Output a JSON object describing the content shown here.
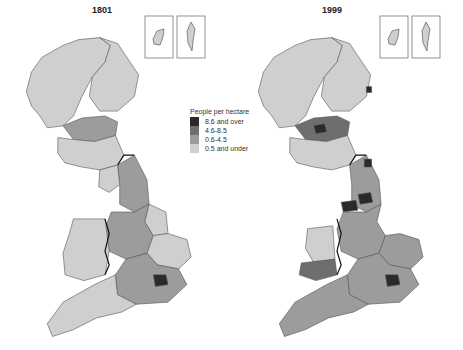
{
  "figure": {
    "title_left": "1801",
    "title_right": "1999"
  },
  "legend": {
    "title": "People per hectare",
    "classes": [
      {
        "label": "8.6 and over",
        "color": "#2a2a2a"
      },
      {
        "label": "4.6-8.5",
        "color": "#6e6e6e"
      },
      {
        "label": "0.6-4.5",
        "color": "#9c9c9c"
      },
      {
        "label": "0.5 and under",
        "color": "#cfcfcf"
      }
    ]
  },
  "chart_data": {
    "type": "choropleth",
    "unit": "People per hectare",
    "legend_title": "People per hectare",
    "legend_position": "center, between the two maps",
    "classes": [
      "8.6 and over",
      "4.6-8.5",
      "0.6-4.5",
      "0.5 and under"
    ],
    "maps": [
      {
        "year": "1801",
        "note": "Mostly '0.5 and under' and '0.6-4.5'; only London in '8.6 and over'",
        "regions": [
          {
            "name": "Highlands & Islands",
            "class": "0.5 and under"
          },
          {
            "name": "North-east Scotland",
            "class": "0.5 and under"
          },
          {
            "name": "Central Scotland",
            "class": "0.6-4.5"
          },
          {
            "name": "Southern Scotland",
            "class": "0.5 and under"
          },
          {
            "name": "Northern England",
            "class": "0.6-4.5"
          },
          {
            "name": "Cumbria",
            "class": "0.5 and under"
          },
          {
            "name": "Midlands",
            "class": "0.6-4.5"
          },
          {
            "name": "Lincolnshire",
            "class": "0.5 and under"
          },
          {
            "name": "East Anglia",
            "class": "0.5 and under"
          },
          {
            "name": "Wales",
            "class": "0.5 and under"
          },
          {
            "name": "South-west England",
            "class": "0.5 and under"
          },
          {
            "name": "South-east England",
            "class": "0.6-4.5"
          },
          {
            "name": "London",
            "class": "8.6 and over"
          },
          {
            "name": "Orkney (inset)",
            "class": "0.5 and under"
          },
          {
            "name": "Shetland (inset)",
            "class": "0.5 and under"
          }
        ]
      },
      {
        "year": "1999",
        "note": "Predominantly '0.6-4.5'; several urban areas in '8.6 and over'",
        "regions": [
          {
            "name": "Highlands & Islands",
            "class": "0.5 and under"
          },
          {
            "name": "North-east Scotland",
            "class": "0.5 and under"
          },
          {
            "name": "Aberdeen",
            "class": "8.6 and over"
          },
          {
            "name": "Central Scotland",
            "class": "4.6-8.5"
          },
          {
            "name": "Glasgow",
            "class": "8.6 and over"
          },
          {
            "name": "Southern Scotland",
            "class": "0.5 and under"
          },
          {
            "name": "Northern England",
            "class": "0.6-4.5"
          },
          {
            "name": "Tyneside",
            "class": "8.6 and over"
          },
          {
            "name": "Greater Manchester & Merseyside",
            "class": "8.6 and over"
          },
          {
            "name": "West Yorkshire",
            "class": "8.6 and over"
          },
          {
            "name": "West Midlands",
            "class": "8.6 and over"
          },
          {
            "name": "Midlands",
            "class": "0.6-4.5"
          },
          {
            "name": "East Anglia",
            "class": "0.6-4.5"
          },
          {
            "name": "Mid Wales",
            "class": "0.5 and under"
          },
          {
            "name": "South Wales",
            "class": "4.6-8.5"
          },
          {
            "name": "South-west England",
            "class": "0.6-4.5"
          },
          {
            "name": "South-east England",
            "class": "0.6-4.5"
          },
          {
            "name": "London",
            "class": "8.6 and over"
          },
          {
            "name": "Orkney (inset)",
            "class": "0.5 and under"
          },
          {
            "name": "Shetland (inset)",
            "class": "0.5 and under"
          }
        ]
      }
    ]
  }
}
